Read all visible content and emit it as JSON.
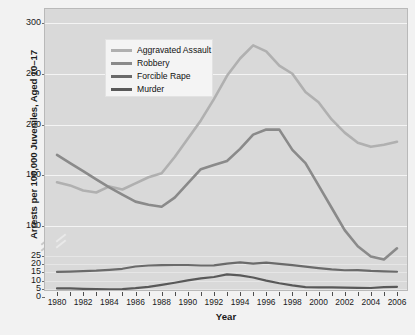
{
  "chart_data": {
    "type": "line",
    "title": "",
    "xlabel": "Year",
    "ylabel": "Arrests per 100,000 Juveniles, Aged 10–17",
    "grid": true,
    "legend_position": "top-left",
    "axis_note": "broken y-axis: compressed band 0–25 below, expanded band 100–300 above",
    "x": [
      1980,
      1981,
      1982,
      1983,
      1984,
      1985,
      1986,
      1987,
      1988,
      1989,
      1990,
      1991,
      1992,
      1993,
      1994,
      1995,
      1996,
      1997,
      1998,
      1999,
      2000,
      2001,
      2002,
      2003,
      2004,
      2005,
      2006
    ],
    "xlim": [
      1980,
      2006
    ],
    "xticks": [
      1980,
      1982,
      1984,
      1986,
      1988,
      1990,
      1992,
      1994,
      1996,
      1998,
      2000,
      2002,
      2004,
      2006
    ],
    "xticklabels": [
      "1980",
      "1982",
      "1984",
      "1986",
      "1988",
      "1990",
      "1992",
      "1994",
      "1996",
      "1998",
      "2000",
      "2002",
      "2004",
      "2006"
    ],
    "yticks_upper": [
      100,
      150,
      200,
      250,
      300
    ],
    "yticklabels_upper": [
      "100",
      "150",
      "200",
      "250",
      "300"
    ],
    "yticks_lower": [
      0,
      5,
      10,
      15,
      20,
      25
    ],
    "yticklabels_lower": [
      "0",
      "5",
      "10",
      "15",
      "20",
      "25"
    ],
    "series": [
      {
        "name": "Aggravated Assault",
        "color": "#b0b0b0",
        "values": [
          143,
          140,
          135,
          133,
          139,
          136,
          142,
          148,
          152,
          168,
          186,
          204,
          225,
          248,
          265,
          278,
          272,
          258,
          250,
          232,
          222,
          205,
          192,
          182,
          178,
          180,
          183
        ]
      },
      {
        "name": "Robbery",
        "color": "#8a8a8a",
        "values": [
          170,
          162,
          154,
          146,
          138,
          131,
          124,
          121,
          119,
          128,
          142,
          156,
          160,
          164,
          176,
          190,
          195,
          195,
          175,
          162,
          140,
          118,
          96,
          80,
          70,
          67,
          78
        ]
      },
      {
        "name": "Forcible Rape",
        "color": "#6a6a6a",
        "values": [
          15.3,
          15.5,
          15.8,
          16.1,
          16.6,
          17.2,
          18.6,
          19.2,
          19.4,
          19.5,
          19.5,
          19.2,
          19.3,
          20.4,
          21.1,
          20.4,
          21.0,
          20.2,
          19.4,
          18.5,
          17.6,
          16.8,
          16.3,
          16.4,
          15.9,
          15.6,
          15.4
        ]
      },
      {
        "name": "Murder",
        "color": "#595959",
        "values": [
          5.2,
          5.3,
          5.0,
          4.8,
          4.7,
          4.8,
          5.4,
          6.2,
          7.4,
          8.7,
          10.1,
          11.4,
          12.2,
          13.8,
          13.2,
          11.9,
          10.0,
          8.4,
          7.1,
          6.0,
          5.9,
          5.9,
          5.7,
          5.6,
          5.5,
          6.0,
          6.2
        ]
      }
    ]
  }
}
